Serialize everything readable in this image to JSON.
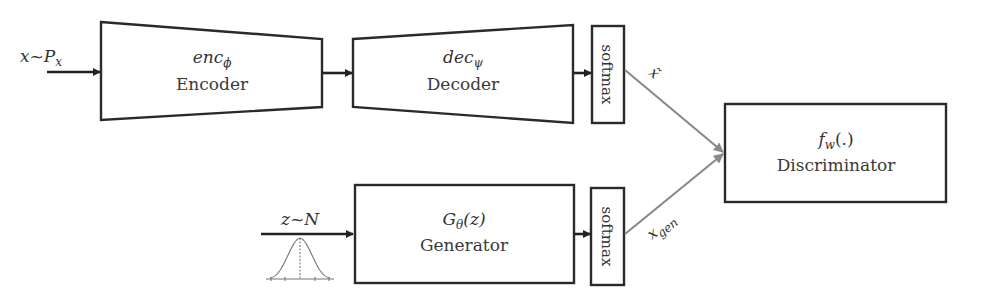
{
  "input": {
    "x_var": "x",
    "tilde": "~",
    "dist": "P",
    "dist_sub": "x"
  },
  "encoder": {
    "func": "enc",
    "func_sub": "ϕ",
    "label": "Encoder"
  },
  "decoder": {
    "func": "dec",
    "func_sub": "ψ",
    "label": "Decoder"
  },
  "softmax_top": {
    "label": "softmax"
  },
  "softmax_bottom": {
    "label": "softmax"
  },
  "noise": {
    "z_var": "z",
    "tilde": "~",
    "dist": "N"
  },
  "generator": {
    "func": "G",
    "func_sub": "θ",
    "func_arg": "(z)",
    "label": "Generator"
  },
  "discriminator": {
    "func": "f",
    "func_sub": "w",
    "func_arg": "(.)",
    "label": "Discriminator"
  },
  "edges": {
    "recon_label": "x̃",
    "gen_label": "x",
    "gen_label_sub": "gen"
  },
  "colors": {
    "stroke": "#2a2a2a",
    "gray_arrow": "#8a8a8a",
    "text": "#333333"
  }
}
